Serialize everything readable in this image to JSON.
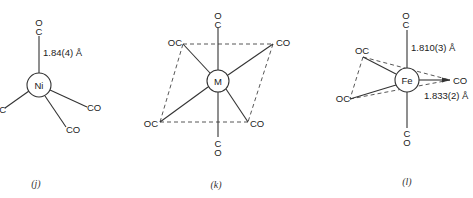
{
  "panels": [
    {
      "id": "j",
      "caption": "(j)",
      "center_label": "Ni",
      "distance_label": "1.84(4) Å",
      "ligands": {
        "top_c": "C",
        "top_o": "O",
        "left": "OC",
        "right": "CO",
        "bottom": "CO"
      }
    },
    {
      "id": "k",
      "caption": "(k)",
      "center_label": "M",
      "ligands": {
        "top_o": "O",
        "top_c": "C",
        "upper_left": "OC",
        "upper_right": "CO",
        "lower_left": "OC",
        "lower_right": "CO",
        "bottom_c": "C",
        "bottom_o": "O"
      }
    },
    {
      "id": "l",
      "caption": "(l)",
      "center_label": "Fe",
      "axial_distance_label": "1.810(3) Å",
      "equatorial_distance_label": "1.833(2) Å",
      "ligands": {
        "top_o": "O",
        "top_c": "C",
        "upper_left": "OC",
        "lower_left": "OC",
        "right": "CO",
        "bottom_c": "C",
        "bottom_o": "O"
      }
    }
  ]
}
